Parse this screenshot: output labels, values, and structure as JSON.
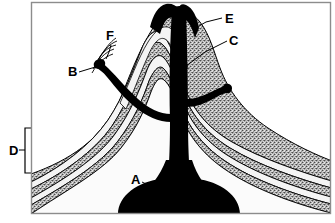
{
  "figure": {
    "type": "volcano-cross-section-diagram",
    "title": "",
    "frame_color": "#8c8c8c",
    "background_color": "#ffffff",
    "ink_color": "#000000",
    "tephra_layer_color": "#9a9a9a",
    "lava_layer_color": "#f2f2f2",
    "magma_color": "#000000"
  },
  "labels": [
    {
      "id": "A",
      "text": "A",
      "x": 131,
      "y": 184,
      "target": "magma-chamber"
    },
    {
      "id": "B",
      "text": "B",
      "x": 68,
      "y": 75,
      "target": "parasitic-cone-vent"
    },
    {
      "id": "C",
      "text": "C",
      "x": 229,
      "y": 40,
      "target": "central-conduit"
    },
    {
      "id": "D",
      "text": "D",
      "x": 10,
      "y": 153,
      "target": "layered-strata"
    },
    {
      "id": "E",
      "text": "E",
      "x": 224,
      "y": 20,
      "target": "summit-crater"
    },
    {
      "id": "F",
      "text": "F",
      "x": 108,
      "y": 40,
      "target": "side-flow-layer"
    }
  ],
  "bracket": {
    "id": "D-bracket",
    "x": 25,
    "top": 128,
    "bottom": 173,
    "tick_length": 7
  },
  "leader_lines": [
    {
      "label": "A",
      "from_x": 141,
      "from_y": 181,
      "to_x": 160,
      "to_y": 192
    },
    {
      "label": "B",
      "from_x": 78,
      "from_y": 71,
      "to_x": 104,
      "to_y": 66
    },
    {
      "label": "C",
      "from_x": 227,
      "from_y": 40,
      "to_x": 186,
      "to_y": 65
    },
    {
      "label": "D",
      "from_x": 19,
      "from_y": 150,
      "to_x": 25,
      "to_y": 150
    },
    {
      "label": "E",
      "from_x": 222,
      "from_y": 18,
      "to_x": 199,
      "to_y": 25
    },
    {
      "label": "F",
      "from_x": 111,
      "from_y": 44,
      "to_x": 106,
      "to_y": 58
    }
  ],
  "strata": {
    "count": 8,
    "description": "alternating tephra and lava layers forming a stratovolcano cone"
  }
}
